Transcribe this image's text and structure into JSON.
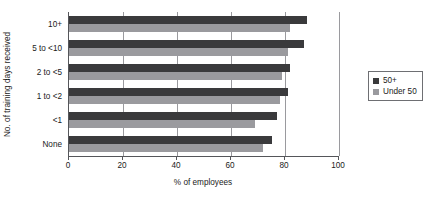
{
  "chart_data": {
    "type": "bar",
    "orientation": "horizontal",
    "title": "",
    "xlabel": "% of employees",
    "ylabel": "No. of training days received",
    "xlim": [
      0,
      100
    ],
    "xticks": [
      0,
      20,
      40,
      60,
      80,
      100
    ],
    "xtick_labels": [
      "0",
      "20",
      "40",
      "60",
      "80",
      "100"
    ],
    "grid": "vertical",
    "legend_position": "right",
    "categories": [
      "10+",
      "5 to <10",
      "2 to <5",
      "1 to <2",
      "<1",
      "None"
    ],
    "series": [
      {
        "name": "50+",
        "color": "#3a3a3c",
        "values": [
          88,
          87,
          82,
          81,
          77,
          75
        ]
      },
      {
        "name": "Under 50",
        "color": "#9a9a9e",
        "values": [
          82,
          81,
          79,
          78,
          69,
          72
        ]
      }
    ]
  },
  "legend": {
    "entries": [
      {
        "label": "50+"
      },
      {
        "label": "Under 50"
      }
    ]
  },
  "colors": {
    "series_50_plus": "#3a3a3c",
    "series_under_50": "#9a9a9e",
    "axis": "#55565a",
    "gridline": "#9a9a9e",
    "background": "#ffffff"
  }
}
